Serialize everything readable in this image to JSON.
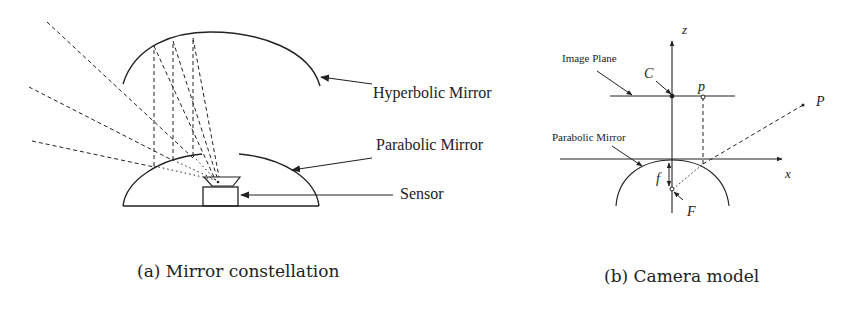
{
  "figure_a": {
    "labels": {
      "hyperbolic_mirror": "Hyperbolic Mirror",
      "parabolic_mirror": "Parabolic Mirror",
      "sensor": "Sensor"
    },
    "caption": "(a) Mirror constellation"
  },
  "figure_b": {
    "labels": {
      "z_axis": "z",
      "x_axis": "x",
      "image_plane": "Image Plane",
      "parabolic_mirror": "Parabolic Mirror",
      "center": "C",
      "image_point": "p",
      "world_point": "P",
      "focal_length": "f",
      "focus": "F"
    },
    "caption": "(b) Camera model"
  },
  "colors": {
    "stroke": "#222222",
    "background": "#ffffff"
  }
}
